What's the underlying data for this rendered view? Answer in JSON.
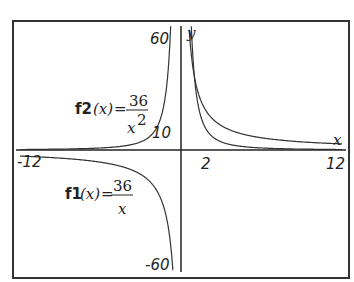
{
  "chart_data": {
    "type": "line",
    "title": "",
    "xlabel": "x",
    "ylabel": "y",
    "xlim": [
      -12,
      12
    ],
    "ylim": [
      -60,
      60
    ],
    "grid": false,
    "x_tick_labels": [
      "-12",
      "2",
      "12"
    ],
    "y_tick_labels": [
      "60",
      "10",
      "-60"
    ],
    "series": [
      {
        "name": "f1(x) = 36/x",
        "label_func": "f1",
        "numerator": "36",
        "denominator": "x",
        "x": [
          -12,
          -6,
          -3,
          -2,
          -1,
          -0.6,
          0.6,
          1,
          2,
          3,
          6,
          12
        ],
        "values": [
          -3,
          -6,
          -12,
          -18,
          -36,
          -60,
          60,
          36,
          18,
          12,
          6,
          3
        ]
      },
      {
        "name": "f2(x) = 36/x^2",
        "label_func": "f2",
        "numerator": "36",
        "denominator": "x",
        "denominator_exp": "2",
        "x": [
          -12,
          -6,
          -3,
          -2,
          -1,
          -0.78,
          0.78,
          1,
          2,
          3,
          6,
          12
        ],
        "values": [
          0.25,
          1,
          4,
          9,
          36,
          60,
          60,
          36,
          9,
          4,
          1,
          0.25
        ]
      }
    ]
  },
  "labels": {
    "x_axis": "x",
    "y_axis": "y",
    "f1_name": "f1",
    "f2_name": "f2",
    "arg": "(x)",
    "eq": "=",
    "num": "36",
    "den_x": "x",
    "exp2": "2",
    "tick_60": "60",
    "tick_10": "10",
    "tick_neg60": "-60",
    "tick_neg12": "-12",
    "tick_2": "2",
    "tick_12": "12"
  }
}
